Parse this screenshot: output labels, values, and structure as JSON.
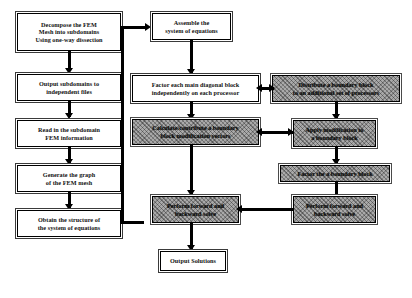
{
  "diagram": {
    "colors": {
      "line": "#000000",
      "box_fill": "#ffffff",
      "shaded_fill": "#a9a9a9",
      "text": "#111111"
    },
    "nodes": {
      "decompose": {
        "style": "plain",
        "lines": [
          "Decompose the FEM",
          "Mesh into subdomains",
          "Using one-way dissection"
        ]
      },
      "output_subdomains": {
        "style": "plain",
        "lines": [
          "Output subdomains to",
          "independent files"
        ]
      },
      "read_subdomain": {
        "style": "plain",
        "lines": [
          "Read in the subdomain",
          "FEM information"
        ]
      },
      "generate_graph": {
        "style": "plain",
        "lines": [
          "Generate the graph",
          "of the FEM mesh"
        ]
      },
      "obtain_structure": {
        "style": "plain",
        "lines": [
          "Obtain the structure of",
          "the system of equations"
        ]
      },
      "assemble": {
        "style": "plain",
        "lines": [
          "Assemble the",
          "system of equations"
        ]
      },
      "factor_diagonal": {
        "style": "plain",
        "lines": [
          "Factor each main diagonal block",
          "independently on each processor"
        ]
      },
      "calculate_modification": {
        "style": "shaded",
        "lines": [
          "Calculate/contribute a boundary",
          "block modification vectors"
        ]
      },
      "perform_solve_mid": {
        "style": "shaded",
        "lines": [
          "Perform forward and",
          "backward solve"
        ]
      },
      "output_solutions": {
        "style": "plain",
        "lines": [
          "Output Solutions"
        ]
      },
      "distribute_block": {
        "style": "shaded",
        "lines": [
          "Distribute a boundary block",
          "to an additional set of processors"
        ]
      },
      "apply_modification": {
        "style": "shaded",
        "lines": [
          "Apply modification to",
          "a boundary block"
        ]
      },
      "factor_boundary": {
        "style": "shaded",
        "lines": [
          "Factor the a boundary block"
        ]
      },
      "perform_solve_right": {
        "style": "shaded",
        "lines": [
          "Perform forward and",
          "backward solve"
        ]
      }
    }
  }
}
